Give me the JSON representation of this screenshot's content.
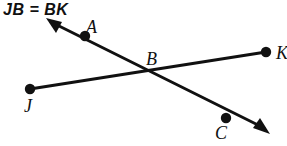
{
  "figure": {
    "title": "JB = BK",
    "width": 287,
    "height": 146,
    "stroke_color": "#111111",
    "background_color": "#ffffff"
  },
  "labels": {
    "A": "A",
    "B": "B",
    "C": "C",
    "J": "J",
    "K": "K"
  },
  "geometry": {
    "points": [
      {
        "name": "A",
        "x": 85,
        "y": 36,
        "dot": true
      },
      {
        "name": "B",
        "x": 151,
        "y": 70,
        "dot": false
      },
      {
        "name": "C",
        "x": 226,
        "y": 118,
        "dot": true
      },
      {
        "name": "J",
        "x": 30,
        "y": 89,
        "dot": true
      },
      {
        "name": "K",
        "x": 266,
        "y": 52,
        "dot": true
      }
    ],
    "segments": [
      {
        "name": "segment-JK",
        "from": "J",
        "to": "K",
        "arrow_start": false,
        "arrow_end": false
      },
      {
        "name": "ray-AC",
        "from": "A",
        "to": "C",
        "arrow_start": true,
        "arrow_end": true
      }
    ],
    "arrow_start_tip": {
      "x": 48,
      "y": 20
    },
    "arrow_end_tip": {
      "x": 268,
      "y": 132
    }
  }
}
